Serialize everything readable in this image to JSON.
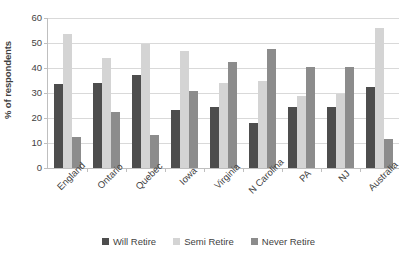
{
  "chart_data": {
    "type": "bar",
    "title": "",
    "xlabel": "",
    "ylabel": "% of respondents",
    "ylim": [
      0,
      60
    ],
    "yticks": [
      0,
      10,
      20,
      30,
      40,
      50,
      60
    ],
    "grid": true,
    "legend_position": "bottom",
    "categories": [
      "England",
      "Ontario",
      "Quebec",
      "Iowa",
      "Virginia",
      "N Carolina",
      "PA",
      "NJ",
      "Australia"
    ],
    "series": [
      {
        "name": "Will Retire",
        "color": "#4d4d4d",
        "values": [
          33.8,
          34.0,
          37.3,
          23.2,
          24.5,
          18.0,
          24.6,
          24.6,
          32.4
        ]
      },
      {
        "name": "Semi Retire",
        "color": "#d4d4d4",
        "values": [
          53.5,
          44.0,
          49.8,
          46.8,
          34.0,
          35.0,
          29.0,
          29.6,
          56.0
        ]
      },
      {
        "name": "Never Retire",
        "color": "#8c8c8c",
        "values": [
          12.6,
          22.4,
          13.4,
          30.8,
          42.6,
          47.5,
          40.5,
          40.5,
          11.5
        ]
      }
    ]
  },
  "legend": {
    "items": [
      {
        "label": "Will Retire"
      },
      {
        "label": "Semi Retire"
      },
      {
        "label": "Never Retire"
      }
    ]
  },
  "colors": {
    "will_retire": "#4d4d4d",
    "semi_retire": "#d4d4d4",
    "never_retire": "#8c8c8c",
    "gridline": "#d9d9d9",
    "axis": "#bfbfbf",
    "text": "#3f3f3f",
    "background": "#ffffff"
  }
}
